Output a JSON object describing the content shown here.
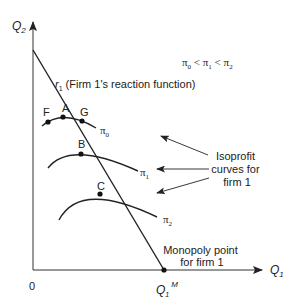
{
  "axes": {
    "y_label": "Q",
    "y_label_sub": "2",
    "x_label": "Q",
    "x_label_sub": "1",
    "origin_label": "0"
  },
  "reaction_function": {
    "label_r": "r",
    "label_r_sub": "1",
    "label_text": "(Firm 1's reaction function)"
  },
  "inequality": {
    "pi0": "π",
    "pi0_sub": "0",
    "lt1": " < ",
    "pi1": "π",
    "pi1_sub": "1",
    "lt2": " < ",
    "pi2": "π",
    "pi2_sub": "2"
  },
  "points": {
    "A": "A",
    "B": "B",
    "C": "C",
    "F": "F",
    "G": "G"
  },
  "curves": {
    "pi0": {
      "sym": "π",
      "sub": "0"
    },
    "pi1": {
      "sym": "π",
      "sub": "1"
    },
    "pi2": {
      "sym": "π",
      "sub": "2"
    }
  },
  "isoprofit_note": {
    "line1": "Isoprofit",
    "line2": "curves for",
    "line3": "firm 1"
  },
  "monopoly_note": {
    "line1": "Monopoly point",
    "line2": "for firm 1"
  },
  "monopoly_quantity": {
    "q": "Q",
    "sub": "1",
    "sup": "M"
  }
}
